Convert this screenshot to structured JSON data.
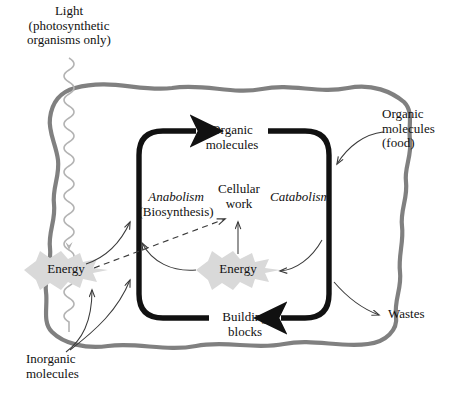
{
  "diagram": {
    "colors": {
      "membrane": "#808080",
      "cycle_loop": "#111111",
      "thin_arrow": "#3a3a3a",
      "light_wave": "#b3b3b3",
      "energy_burst": "#d8d8d8",
      "background": "#ffffff",
      "text": "#111111"
    },
    "labels": {
      "light": {
        "line1": "Light",
        "line2": "(photosynthetic",
        "line3": "organisms only)"
      },
      "organic_molecules_inner": {
        "line1": "Organic",
        "line2": "molecules"
      },
      "organic_molecules_food": {
        "line1": "Organic",
        "line2": "molecules",
        "line3": "(food)"
      },
      "anabolism": {
        "line1": "Anabolism",
        "line2": "(Biosynthesis)"
      },
      "catabolism": {
        "line1": "Catabolism"
      },
      "cellular_work": {
        "line1": "Cellular",
        "line2": "work"
      },
      "energy_left": {
        "line1": "Energy"
      },
      "energy_center": {
        "line1": "Energy"
      },
      "building_blocks": {
        "line1": "Building",
        "line2": "blocks"
      },
      "inorganic_molecules": {
        "line1": "Inorganic",
        "line2": "molecules"
      },
      "wastes": {
        "line1": "Wastes"
      }
    },
    "flows": [
      {
        "name": "light-into-cell",
        "from": "Light",
        "to": "Energy (left)",
        "style": "wavy-line-with-arrow"
      },
      {
        "name": "organic-food-into-cycle",
        "from": "Organic molecules (food)",
        "to": "Catabolism branch",
        "style": "thin-curved-arrow"
      },
      {
        "name": "catabolism-to-wastes",
        "from": "Catabolism branch",
        "to": "Wastes",
        "style": "thin-curved-arrow"
      },
      {
        "name": "inorganic-to-energy",
        "from": "Inorganic molecules",
        "to": "Energy (left)",
        "style": "thin-curved-arrow"
      },
      {
        "name": "inorganic-to-anabolism",
        "from": "Inorganic molecules",
        "to": "Anabolism branch",
        "style": "thin-curved-arrow"
      },
      {
        "name": "energy-left-to-anabolism",
        "from": "Energy (left)",
        "to": "Anabolism branch",
        "style": "thin-curved-arrow"
      },
      {
        "name": "energy-left-to-cellular-work",
        "from": "Energy (left)",
        "to": "Cellular work",
        "style": "dashed-arrow"
      },
      {
        "name": "energy-center-to-cellular-work",
        "from": "Energy (center)",
        "to": "Cellular work",
        "style": "thin-straight-arrow"
      },
      {
        "name": "energy-center-to-anabolism",
        "from": "Energy (center)",
        "to": "Anabolism branch",
        "style": "thin-curved-arrow"
      },
      {
        "name": "catabolism-to-energy-center",
        "from": "Catabolism branch",
        "to": "Energy (center)",
        "style": "thin-curved-arrow"
      },
      {
        "name": "cycle-anabolism-up",
        "from": "Building blocks",
        "to": "Organic molecules",
        "style": "thick-black-arrow"
      },
      {
        "name": "cycle-catabolism-down",
        "from": "Organic molecules",
        "to": "Building blocks",
        "style": "thick-black-arrow"
      }
    ]
  }
}
